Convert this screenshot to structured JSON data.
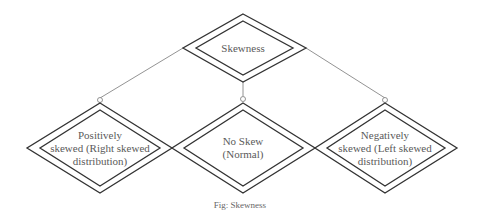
{
  "diagram": {
    "root": {
      "label": "Skewness"
    },
    "children": [
      {
        "label_lines": [
          "Positively",
          "skewed (Right skewed",
          "distribution)"
        ]
      },
      {
        "label_lines": [
          "No Skew",
          "(Normal)"
        ]
      },
      {
        "label_lines": [
          "Negatively",
          "skewed (Left skewed",
          "distribution)"
        ]
      }
    ],
    "caption": "Fig: Skewness"
  }
}
